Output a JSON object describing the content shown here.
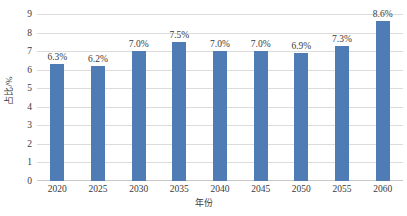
{
  "chart_data": {
    "type": "bar",
    "title": "",
    "xlabel": "年份",
    "ylabel": "占比/%",
    "categories": [
      "2020",
      "2025",
      "2030",
      "2035",
      "2040",
      "2045",
      "2050",
      "2055",
      "2060"
    ],
    "values": [
      6.3,
      6.2,
      7.0,
      7.5,
      7.0,
      7.0,
      6.9,
      7.3,
      8.6
    ],
    "data_labels": [
      "6.3%",
      "6.2%",
      "7.0%",
      "7.5%",
      "7.0%",
      "7.0%",
      "6.9%",
      "7.3%",
      "8.6%"
    ],
    "ylim": [
      0,
      9
    ],
    "ytick_labels": [
      "9",
      "8",
      "7",
      "6",
      "5",
      "4",
      "3",
      "2",
      "1",
      "0"
    ],
    "ytick_values": [
      9,
      8,
      7,
      6,
      5,
      4,
      3,
      2,
      1,
      0
    ],
    "grid": true,
    "legend": "none",
    "series_color": "#4f7cb4",
    "gridline_color": "#dcdcdc",
    "text_color": "#3a3a3a",
    "background_color": "#ffffff"
  }
}
